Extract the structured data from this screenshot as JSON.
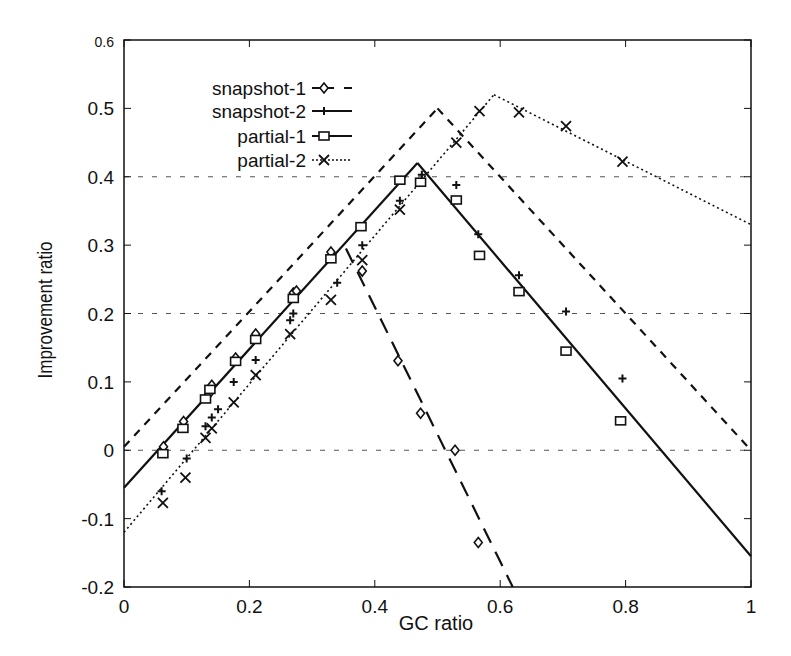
{
  "chart_data": {
    "type": "line",
    "title": "",
    "xlabel": "GC ratio",
    "ylabel": "Improvement ratio",
    "xlim": [
      0,
      1
    ],
    "ylim": [
      -0.2,
      0.6
    ],
    "x_ticks": [
      "0",
      "0.2",
      "0.4",
      "0.6",
      "0.8",
      "1"
    ],
    "y_ticks": [
      "0.6",
      "0.5",
      "0.4",
      "0.3",
      "0.2",
      "0.1",
      "0",
      "-0.1",
      "-0.2"
    ],
    "grid": {
      "horizontal_dotted_at": [
        0.4,
        0.2,
        0.0
      ]
    },
    "legend_position": "upper-left",
    "series": [
      {
        "name": "snapshot-1",
        "marker": "diamond",
        "line_style": "long-dash",
        "points": [
          {
            "x": 0.063,
            "y": 0.005
          },
          {
            "x": 0.095,
            "y": 0.042
          },
          {
            "x": 0.135,
            "y": 0.082
          },
          {
            "x": 0.14,
            "y": 0.095
          },
          {
            "x": 0.178,
            "y": 0.135
          },
          {
            "x": 0.21,
            "y": 0.17
          },
          {
            "x": 0.27,
            "y": 0.23
          },
          {
            "x": 0.275,
            "y": 0.233
          },
          {
            "x": 0.33,
            "y": 0.29
          },
          {
            "x": 0.38,
            "y": 0.262
          },
          {
            "x": 0.437,
            "y": 0.131
          },
          {
            "x": 0.473,
            "y": 0.054
          },
          {
            "x": 0.528,
            "y": 0.0
          },
          {
            "x": 0.565,
            "y": -0.135
          }
        ],
        "fit_lines": [
          {
            "from": [
              0,
              -0.055
            ],
            "to": [
              0.47,
              0.42
            ]
          },
          {
            "from": [
              0.354,
              0.295
            ],
            "to": [
              0.62,
              -0.2
            ]
          }
        ]
      },
      {
        "name": "snapshot-2",
        "marker": "plus",
        "line_style": "solid",
        "points": [
          {
            "x": 0.06,
            "y": -0.06
          },
          {
            "x": 0.1,
            "y": -0.012
          },
          {
            "x": 0.13,
            "y": 0.035
          },
          {
            "x": 0.14,
            "y": 0.048
          },
          {
            "x": 0.15,
            "y": 0.06
          },
          {
            "x": 0.175,
            "y": 0.1
          },
          {
            "x": 0.21,
            "y": 0.132
          },
          {
            "x": 0.265,
            "y": 0.19
          },
          {
            "x": 0.27,
            "y": 0.2
          },
          {
            "x": 0.34,
            "y": 0.245
          },
          {
            "x": 0.38,
            "y": 0.3
          },
          {
            "x": 0.44,
            "y": 0.365
          },
          {
            "x": 0.475,
            "y": 0.403
          },
          {
            "x": 0.53,
            "y": 0.388
          },
          {
            "x": 0.565,
            "y": 0.316
          },
          {
            "x": 0.63,
            "y": 0.256
          },
          {
            "x": 0.705,
            "y": 0.203
          },
          {
            "x": 0.795,
            "y": 0.105
          }
        ],
        "fit_lines": [
          {
            "from": [
              0,
              0.005
            ],
            "to": [
              0.5,
              0.5
            ]
          },
          {
            "from": [
              0.5,
              0.5
            ],
            "to": [
              1,
              0.0
            ]
          }
        ]
      },
      {
        "name": "partial-1",
        "marker": "square",
        "line_style": "solid",
        "points": [
          {
            "x": 0.062,
            "y": -0.005
          },
          {
            "x": 0.094,
            "y": 0.032
          },
          {
            "x": 0.13,
            "y": 0.075
          },
          {
            "x": 0.137,
            "y": 0.089
          },
          {
            "x": 0.178,
            "y": 0.13
          },
          {
            "x": 0.21,
            "y": 0.162
          },
          {
            "x": 0.27,
            "y": 0.222
          },
          {
            "x": 0.33,
            "y": 0.28
          },
          {
            "x": 0.378,
            "y": 0.327
          },
          {
            "x": 0.44,
            "y": 0.395
          },
          {
            "x": 0.473,
            "y": 0.392
          },
          {
            "x": 0.53,
            "y": 0.366
          },
          {
            "x": 0.567,
            "y": 0.285
          },
          {
            "x": 0.63,
            "y": 0.232
          },
          {
            "x": 0.705,
            "y": 0.145
          },
          {
            "x": 0.792,
            "y": 0.043
          }
        ],
        "fit_lines": [
          {
            "from": [
              0,
              -0.055
            ],
            "to": [
              0.468,
              0.42
            ]
          },
          {
            "from": [
              0.468,
              0.42
            ],
            "to": [
              1,
              -0.155
            ]
          }
        ]
      },
      {
        "name": "partial-2",
        "marker": "cross",
        "line_style": "dotted",
        "points": [
          {
            "x": 0.062,
            "y": -0.077
          },
          {
            "x": 0.098,
            "y": -0.04
          },
          {
            "x": 0.13,
            "y": 0.018
          },
          {
            "x": 0.14,
            "y": 0.032
          },
          {
            "x": 0.175,
            "y": 0.07
          },
          {
            "x": 0.21,
            "y": 0.11
          },
          {
            "x": 0.265,
            "y": 0.17
          },
          {
            "x": 0.33,
            "y": 0.22
          },
          {
            "x": 0.38,
            "y": 0.278
          },
          {
            "x": 0.44,
            "y": 0.352
          },
          {
            "x": 0.53,
            "y": 0.45
          },
          {
            "x": 0.567,
            "y": 0.496
          },
          {
            "x": 0.63,
            "y": 0.494
          },
          {
            "x": 0.705,
            "y": 0.474
          },
          {
            "x": 0.795,
            "y": 0.422
          }
        ],
        "fit_lines": [
          {
            "from": [
              0,
              -0.12
            ],
            "to": [
              0.59,
              0.52
            ]
          },
          {
            "from": [
              0.59,
              0.52
            ],
            "to": [
              1,
              0.33
            ]
          }
        ]
      }
    ]
  }
}
